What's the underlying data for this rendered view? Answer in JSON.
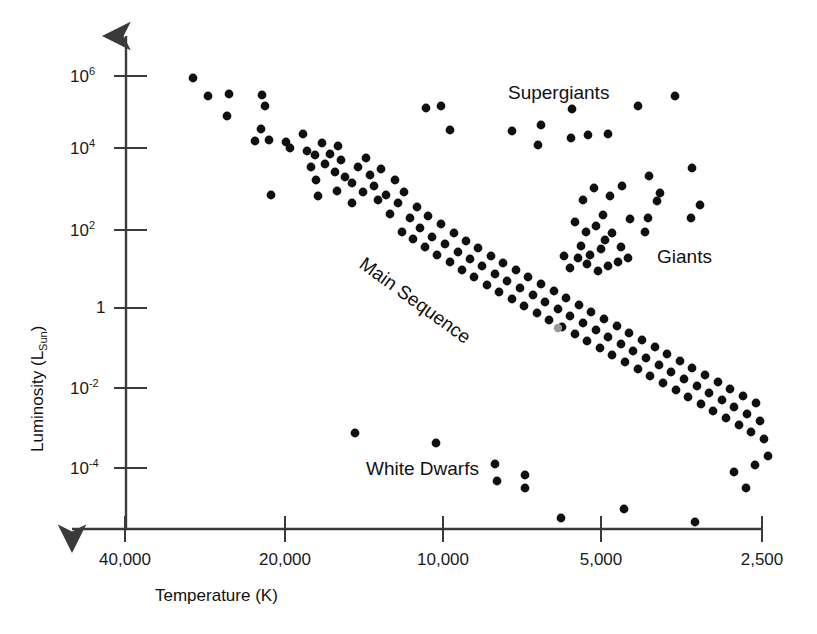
{
  "chart_data": {
    "type": "scatter",
    "title": "",
    "subtitle": "",
    "xlabel": "Temperature (K)",
    "ylabel": "Luminosity (L_Sun)",
    "ylabel_base": "Luminosity (L",
    "ylabel_sub": "Sun",
    "ylabel_tail": ")",
    "xscale": "log-reversed",
    "yscale": "log",
    "grid": false,
    "legend": "none",
    "xlim": [
      40000,
      2500
    ],
    "ylim": [
      1e-05,
      5000000.0
    ],
    "x_ticks": [
      {
        "label": "40,000",
        "value": 40000,
        "px": 125
      },
      {
        "label": "20,000",
        "value": 20000,
        "px": 285
      },
      {
        "label": "10,000",
        "value": 10000,
        "px": 443
      },
      {
        "label": "5,000",
        "value": 5000,
        "px": 601
      },
      {
        "label": "2,500",
        "value": 2500,
        "px": 762
      }
    ],
    "y_ticks": [
      {
        "label_base": "10",
        "label_exp": "6",
        "value": 1000000,
        "px": 76
      },
      {
        "label_base": "10",
        "label_exp": "4",
        "value": 10000,
        "px": 148
      },
      {
        "label_base": "10",
        "label_exp": "2",
        "value": 100,
        "px": 230
      },
      {
        "label_base": "1",
        "label_exp": "",
        "value": 1,
        "px": 308
      },
      {
        "label_base": "10",
        "label_exp": "-2",
        "value": 0.01,
        "px": 388
      },
      {
        "label_base": "10",
        "label_exp": "-4",
        "value": 0.0001,
        "px": 468
      }
    ],
    "annotations": [
      {
        "name": "supergiants",
        "text": "Supergiants",
        "x": 508,
        "y": 82,
        "rotation": 0
      },
      {
        "name": "giants",
        "text": "Giants",
        "x": 657,
        "y": 246,
        "rotation": 0
      },
      {
        "name": "main-sequence",
        "text": "Main Sequence",
        "x": 368,
        "y": 253,
        "rotation": 36
      },
      {
        "name": "white-dwarfs",
        "text": "White Dwarfs",
        "x": 366,
        "y": 458,
        "rotation": 0
      }
    ],
    "marker": {
      "shape": "circle",
      "radius": 4.4,
      "color": "#101010"
    },
    "highlight_marker": {
      "shape": "circle",
      "radius": 4.2,
      "color": "#9a9a9a",
      "note": "Sun"
    },
    "series": [
      {
        "name": "stars",
        "color": "#101010",
        "points": [
          [
            193,
            78
          ],
          [
            208,
            96
          ],
          [
            229,
            94
          ],
          [
            227,
            116
          ],
          [
            262,
            95
          ],
          [
            265,
            106
          ],
          [
            261,
            129
          ],
          [
            255,
            141
          ],
          [
            269,
            140
          ],
          [
            271,
            195
          ],
          [
            286,
            142
          ],
          [
            290,
            148
          ],
          [
            303,
            134
          ],
          [
            307,
            151
          ],
          [
            311,
            167
          ],
          [
            315,
            155
          ],
          [
            316,
            180
          ],
          [
            322,
            143
          ],
          [
            325,
            164
          ],
          [
            330,
            154
          ],
          [
            335,
            172
          ],
          [
            338,
            146
          ],
          [
            341,
            160
          ],
          [
            345,
            177
          ],
          [
            318,
            196
          ],
          [
            337,
            191
          ],
          [
            352,
            183
          ],
          [
            358,
            167
          ],
          [
            352,
            203
          ],
          [
            363,
            192
          ],
          [
            366,
            158
          ],
          [
            370,
            175
          ],
          [
            374,
            186
          ],
          [
            378,
            200
          ],
          [
            381,
            169
          ],
          [
            386,
            195
          ],
          [
            390,
            214
          ],
          [
            395,
            180
          ],
          [
            398,
            203
          ],
          [
            402,
            232
          ],
          [
            404,
            192
          ],
          [
            410,
            218
          ],
          [
            413,
            239
          ],
          [
            417,
            207
          ],
          [
            420,
            228
          ],
          [
            425,
            247
          ],
          [
            428,
            216
          ],
          [
            432,
            237
          ],
          [
            437,
            255
          ],
          [
            441,
            224
          ],
          [
            445,
            244
          ],
          [
            450,
            262
          ],
          [
            454,
            233
          ],
          [
            458,
            252
          ],
          [
            462,
            270
          ],
          [
            466,
            241
          ],
          [
            470,
            259
          ],
          [
            474,
            277
          ],
          [
            478,
            248
          ],
          [
            482,
            266
          ],
          [
            487,
            285
          ],
          [
            491,
            256
          ],
          [
            495,
            274
          ],
          [
            499,
            292
          ],
          [
            503,
            263
          ],
          [
            507,
            281
          ],
          [
            512,
            299
          ],
          [
            516,
            270
          ],
          [
            520,
            288
          ],
          [
            524,
            306
          ],
          [
            528,
            277
          ],
          [
            533,
            295
          ],
          [
            537,
            313
          ],
          [
            541,
            284
          ],
          [
            545,
            302
          ],
          [
            549,
            320
          ],
          [
            554,
            291
          ],
          [
            558,
            309
          ],
          [
            562,
            327
          ],
          [
            566,
            298
          ],
          [
            570,
            316
          ],
          [
            575,
            334
          ],
          [
            579,
            305
          ],
          [
            583,
            323
          ],
          [
            587,
            341
          ],
          [
            591,
            312
          ],
          [
            596,
            330
          ],
          [
            600,
            348
          ],
          [
            604,
            319
          ],
          [
            608,
            337
          ],
          [
            612,
            355
          ],
          [
            617,
            326
          ],
          [
            621,
            344
          ],
          [
            625,
            362
          ],
          [
            629,
            333
          ],
          [
            633,
            351
          ],
          [
            638,
            369
          ],
          [
            642,
            340
          ],
          [
            646,
            358
          ],
          [
            650,
            376
          ],
          [
            655,
            347
          ],
          [
            659,
            365
          ],
          [
            663,
            383
          ],
          [
            667,
            354
          ],
          [
            671,
            372
          ],
          [
            676,
            390
          ],
          [
            680,
            361
          ],
          [
            684,
            379
          ],
          [
            688,
            397
          ],
          [
            692,
            368
          ],
          [
            697,
            386
          ],
          [
            701,
            404
          ],
          [
            705,
            375
          ],
          [
            709,
            393
          ],
          [
            713,
            411
          ],
          [
            718,
            382
          ],
          [
            722,
            400
          ],
          [
            726,
            418
          ],
          [
            730,
            389
          ],
          [
            734,
            407
          ],
          [
            739,
            425
          ],
          [
            743,
            396
          ],
          [
            747,
            414
          ],
          [
            751,
            432
          ],
          [
            756,
            403
          ],
          [
            760,
            421
          ],
          [
            764,
            439
          ],
          [
            768,
            456
          ],
          [
            755,
            465
          ],
          [
            734,
            472
          ],
          [
            746,
            488
          ],
          [
            426,
            108
          ],
          [
            441,
            106
          ],
          [
            450,
            130
          ],
          [
            512,
            131
          ],
          [
            541,
            125
          ],
          [
            538,
            145
          ],
          [
            572,
            109
          ],
          [
            571,
            138
          ],
          [
            588,
            135
          ],
          [
            608,
            134
          ],
          [
            638,
            106
          ],
          [
            675,
            96
          ],
          [
            583,
            200
          ],
          [
            594,
            188
          ],
          [
            603,
            215
          ],
          [
            610,
            196
          ],
          [
            575,
            222
          ],
          [
            586,
            232
          ],
          [
            596,
            226
          ],
          [
            605,
            240
          ],
          [
            581,
            246
          ],
          [
            590,
            255
          ],
          [
            601,
            249
          ],
          [
            612,
            233
          ],
          [
            621,
            247
          ],
          [
            630,
            219
          ],
          [
            618,
            262
          ],
          [
            628,
            258
          ],
          [
            608,
            266
          ],
          [
            598,
            271
          ],
          [
            587,
            264
          ],
          [
            578,
            258
          ],
          [
            570,
            268
          ],
          [
            564,
            256
          ],
          [
            622,
            186
          ],
          [
            649,
            176
          ],
          [
            660,
            193
          ],
          [
            657,
            201
          ],
          [
            692,
            168
          ],
          [
            648,
            218
          ],
          [
            645,
            232
          ],
          [
            700,
            205
          ],
          [
            691,
            218
          ],
          [
            355,
            433
          ],
          [
            436,
            443
          ],
          [
            495,
            464
          ],
          [
            497,
            481
          ],
          [
            525,
            475
          ],
          [
            525,
            488
          ],
          [
            561,
            518
          ],
          [
            624,
            509
          ],
          [
            695,
            522
          ]
        ]
      }
    ],
    "highlight_points": [
      [
        558,
        328
      ]
    ]
  },
  "axes": {
    "x_arrow_direction": "left",
    "y_arrow_direction": "up"
  }
}
